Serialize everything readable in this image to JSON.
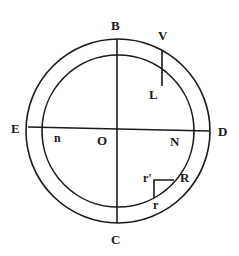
{
  "diagram": {
    "colors": {
      "stroke": "#1a1a1a",
      "background": "#ffffff"
    },
    "labels": {
      "B": "B",
      "V": "V",
      "L": "L",
      "E": "E",
      "n": "n",
      "O": "O",
      "N": "N",
      "D": "D",
      "r_prime": "r'",
      "R": "R",
      "r": "r",
      "C": "C"
    }
  }
}
